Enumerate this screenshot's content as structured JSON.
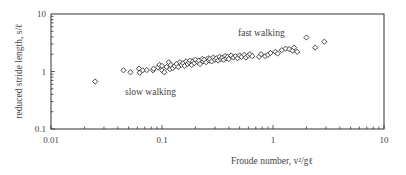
{
  "chart_data": {
    "type": "scatter",
    "title": "",
    "xlabel": "Froude number, v²/gℓ",
    "ylabel": "reduced stride length, s/ℓ",
    "xscale": "log",
    "yscale": "log",
    "xlim": [
      0.01,
      10
    ],
    "ylim": [
      0.1,
      10
    ],
    "x_ticks": [
      "0.01",
      "0.1",
      "1",
      "10"
    ],
    "y_ticks": [
      "0.1",
      "1",
      "10"
    ],
    "grid": false,
    "legend": null,
    "marker": "diamond-open",
    "annotations": [
      {
        "text": "slow walking",
        "x": 0.07,
        "y": 0.55
      },
      {
        "text": "fast walking",
        "x": 0.3,
        "y": 3.3
      }
    ],
    "series": [
      {
        "name": "walking",
        "points": [
          [
            0.025,
            0.67
          ],
          [
            0.045,
            1.05
          ],
          [
            0.052,
            0.97
          ],
          [
            0.062,
            1.12
          ],
          [
            0.063,
            0.95
          ],
          [
            0.067,
            1.05
          ],
          [
            0.073,
            1.06
          ],
          [
            0.083,
            1.05
          ],
          [
            0.084,
            1.12
          ],
          [
            0.092,
            1.18
          ],
          [
            0.095,
            1.3
          ],
          [
            0.1,
            1.25
          ],
          [
            0.1,
            1.05
          ],
          [
            0.105,
            0.97
          ],
          [
            0.11,
            1.2
          ],
          [
            0.115,
            1.45
          ],
          [
            0.118,
            1.1
          ],
          [
            0.12,
            1.3
          ],
          [
            0.125,
            1.15
          ],
          [
            0.13,
            1.25
          ],
          [
            0.135,
            1.35
          ],
          [
            0.14,
            1.2
          ],
          [
            0.145,
            1.45
          ],
          [
            0.15,
            1.3
          ],
          [
            0.155,
            1.4
          ],
          [
            0.16,
            1.25
          ],
          [
            0.165,
            1.5
          ],
          [
            0.17,
            1.35
          ],
          [
            0.175,
            1.45
          ],
          [
            0.18,
            1.55
          ],
          [
            0.185,
            1.3
          ],
          [
            0.19,
            1.5
          ],
          [
            0.195,
            1.4
          ],
          [
            0.2,
            1.6
          ],
          [
            0.21,
            1.45
          ],
          [
            0.215,
            1.55
          ],
          [
            0.22,
            1.35
          ],
          [
            0.23,
            1.65
          ],
          [
            0.235,
            1.5
          ],
          [
            0.24,
            1.6
          ],
          [
            0.25,
            1.45
          ],
          [
            0.26,
            1.7
          ],
          [
            0.265,
            1.55
          ],
          [
            0.27,
            1.65
          ],
          [
            0.28,
            1.5
          ],
          [
            0.29,
            1.75
          ],
          [
            0.3,
            1.6
          ],
          [
            0.31,
            1.7
          ],
          [
            0.32,
            1.55
          ],
          [
            0.33,
            1.8
          ],
          [
            0.34,
            1.65
          ],
          [
            0.35,
            1.75
          ],
          [
            0.36,
            1.6
          ],
          [
            0.37,
            1.85
          ],
          [
            0.38,
            1.7
          ],
          [
            0.39,
            1.8
          ],
          [
            0.4,
            1.65
          ],
          [
            0.42,
            1.9
          ],
          [
            0.44,
            1.75
          ],
          [
            0.46,
            1.85
          ],
          [
            0.48,
            1.7
          ],
          [
            0.5,
            1.9
          ],
          [
            0.52,
            1.8
          ],
          [
            0.55,
            1.95
          ],
          [
            0.57,
            1.75
          ],
          [
            0.6,
            1.9
          ],
          [
            0.62,
            2.0
          ],
          [
            0.65,
            1.85
          ],
          [
            0.75,
            1.8
          ],
          [
            0.78,
            2.0
          ],
          [
            0.85,
            1.85
          ],
          [
            0.9,
            1.95
          ],
          [
            0.95,
            2.1
          ],
          [
            1.05,
            2.2
          ],
          [
            1.1,
            2.05
          ],
          [
            1.2,
            2.35
          ],
          [
            1.3,
            2.5
          ],
          [
            1.4,
            2.45
          ],
          [
            1.5,
            2.3
          ],
          [
            1.55,
            2.6
          ],
          [
            1.65,
            2.2
          ],
          [
            2.0,
            3.9
          ],
          [
            2.4,
            2.6
          ],
          [
            2.9,
            3.3
          ]
        ]
      }
    ]
  }
}
